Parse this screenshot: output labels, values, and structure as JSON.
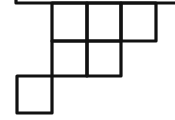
{
  "diagram": {
    "stroke_color": "#111111",
    "background_color": "#ffffff",
    "top_line": {
      "x1": 16,
      "y1": 2,
      "x2": 175,
      "y2": 2
    },
    "rows": [
      {
        "row": 1,
        "cells": 3
      },
      {
        "row": 2,
        "cells": 2
      },
      {
        "row": 3,
        "cells": 1
      }
    ],
    "cells": [
      {
        "id": "r1c1",
        "x": 52,
        "y": 3,
        "w": 35,
        "h": 38
      },
      {
        "id": "r1c2",
        "x": 87,
        "y": 3,
        "w": 34,
        "h": 38
      },
      {
        "id": "r1c3",
        "x": 121,
        "y": 3,
        "w": 35,
        "h": 38
      },
      {
        "id": "r2c1",
        "x": 52,
        "y": 41,
        "w": 35,
        "h": 35
      },
      {
        "id": "r2c2",
        "x": 87,
        "y": 41,
        "w": 34,
        "h": 35
      },
      {
        "id": "r3c1",
        "x": 17,
        "y": 76,
        "w": 35,
        "h": 37
      }
    ]
  }
}
